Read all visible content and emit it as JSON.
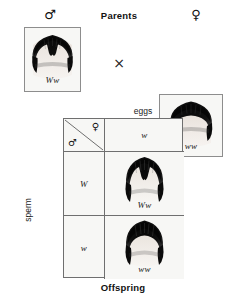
{
  "diagram": {
    "title_parents": "Parents",
    "title_offspring": "Offspring",
    "eggs_label": "eggs",
    "sperm_label": "sperm",
    "cross_symbol": "×",
    "male_symbol": "♂",
    "female_symbol": "♀",
    "colors": {
      "border": "#6f6f6f",
      "photo_border": "#8d8d8d",
      "cell_background": "#f7f7f5",
      "hair": "#0d0d0d",
      "skin": "#efe9e4",
      "text": "#1a1a1a"
    }
  },
  "parents": {
    "father": {
      "sex_symbol": "♂",
      "genotype": "Ww",
      "trait": "widows-peak",
      "photo_alt": "hairline with widow's peak"
    },
    "mother": {
      "sex_symbol": "♀",
      "genotype": "ww",
      "trait": "straight-hairline",
      "photo_alt": "straight hairline"
    }
  },
  "punnett": {
    "corner": {
      "female_symbol": "♀",
      "male_symbol": "♂"
    },
    "column_headers": [
      {
        "allele": "w"
      }
    ],
    "row_headers": [
      {
        "allele": "W"
      },
      {
        "allele": "w"
      }
    ],
    "cells": [
      {
        "genotype": "Ww",
        "trait": "widows-peak",
        "row": 0,
        "col": 0
      },
      {
        "genotype": "ww",
        "trait": "straight-hairline",
        "row": 1,
        "col": 0
      }
    ]
  }
}
